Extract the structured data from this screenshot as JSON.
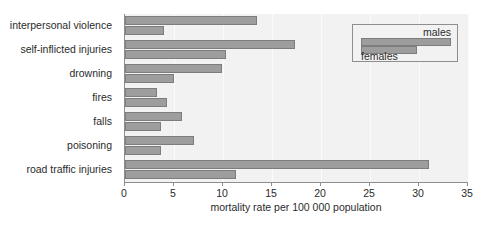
{
  "chart_data": {
    "type": "bar",
    "orientation": "horizontal",
    "title": "",
    "xlabel": "mortality rate per 100 000 population",
    "ylabel": "",
    "xlim": [
      0,
      35
    ],
    "xticks": [
      0,
      5,
      10,
      15,
      20,
      25,
      30,
      35
    ],
    "xtick_labels": [
      "0",
      "5",
      "10",
      "15",
      "20",
      "25",
      "30",
      "35"
    ],
    "grid": true,
    "legend_position": "top-right",
    "categories": [
      "interpersonal violence",
      "self-inflicted injuries",
      "drowning",
      "fires",
      "falls",
      "poisoning",
      "road traffic injuries"
    ],
    "series": [
      {
        "name": "males",
        "values": [
          13.5,
          17.3,
          9.9,
          3.3,
          5.8,
          7.0,
          31.0
        ]
      },
      {
        "name": "females",
        "values": [
          4.0,
          10.3,
          5.0,
          4.3,
          3.7,
          3.7,
          11.3
        ]
      }
    ],
    "colors": {
      "bar_fill": "#9d9d9d",
      "bar_stroke": "#7d7d7d",
      "plot_background": "#f2f2f2",
      "axis": "#8e8e8e",
      "text": "#2b2b2b"
    }
  },
  "legend": {
    "males_label": "males",
    "females_label": "females"
  }
}
